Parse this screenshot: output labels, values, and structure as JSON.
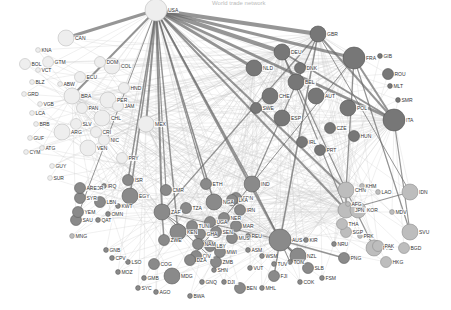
{
  "title": "World trade network",
  "colors": {
    "cluster_americas": "#eeeeee",
    "cluster_europe": "#777777",
    "cluster_africa_asia": "#8a8a8a",
    "cluster_pacific": "#bdbdbd",
    "edge_dark": "#6a6a6a",
    "edge_light": "#c8c8c8"
  },
  "clusters": [
    {
      "name": "americas",
      "color_key": "cluster_americas"
    },
    {
      "name": "europe",
      "color_key": "cluster_europe"
    },
    {
      "name": "africa_asia",
      "color_key": "cluster_africa_asia"
    },
    {
      "name": "pacific",
      "color_key": "cluster_pacific"
    }
  ],
  "nodes": [
    {
      "id": "USA",
      "cluster": "americas",
      "size": "xl"
    },
    {
      "id": "CAN",
      "cluster": "americas",
      "size": "l"
    },
    {
      "id": "KNA",
      "cluster": "americas",
      "size": "s"
    },
    {
      "id": "BOL",
      "cluster": "americas",
      "size": "m"
    },
    {
      "id": "VCT",
      "cluster": "americas",
      "size": "s"
    },
    {
      "id": "GTM",
      "cluster": "americas",
      "size": "m"
    },
    {
      "id": "BLZ",
      "cluster": "americas",
      "size": "s"
    },
    {
      "id": "ABW",
      "cluster": "americas",
      "size": "s"
    },
    {
      "id": "GRD",
      "cluster": "americas",
      "size": "s"
    },
    {
      "id": "VGB",
      "cluster": "americas",
      "size": "s"
    },
    {
      "id": "LCA",
      "cluster": "americas",
      "size": "s"
    },
    {
      "id": "BRB",
      "cluster": "americas",
      "size": "s"
    },
    {
      "id": "GUF",
      "cluster": "americas",
      "size": "s"
    },
    {
      "id": "CYM",
      "cluster": "americas",
      "size": "s"
    },
    {
      "id": "ATG",
      "cluster": "americas",
      "size": "s"
    },
    {
      "id": "GUY",
      "cluster": "americas",
      "size": "s"
    },
    {
      "id": "SUR",
      "cluster": "americas",
      "size": "s"
    },
    {
      "id": "COL",
      "cluster": "americas",
      "size": "l"
    },
    {
      "id": "ECU",
      "cluster": "americas",
      "size": "m"
    },
    {
      "id": "DOM",
      "cluster": "americas",
      "size": "m"
    },
    {
      "id": "HND",
      "cluster": "americas",
      "size": "m"
    },
    {
      "id": "PER",
      "cluster": "americas",
      "size": "l"
    },
    {
      "id": "CHL",
      "cluster": "americas",
      "size": "l"
    },
    {
      "id": "SLV",
      "cluster": "americas",
      "size": "m"
    },
    {
      "id": "PAN",
      "cluster": "americas",
      "size": "m"
    },
    {
      "id": "CRI",
      "cluster": "americas",
      "size": "m"
    },
    {
      "id": "NIC",
      "cluster": "americas",
      "size": "m"
    },
    {
      "id": "VEN",
      "cluster": "americas",
      "size": "l"
    },
    {
      "id": "PRY",
      "cluster": "americas",
      "size": "m"
    },
    {
      "id": "JAM",
      "cluster": "americas",
      "size": "m"
    },
    {
      "id": "MEX",
      "cluster": "americas",
      "size": "l"
    },
    {
      "id": "BRA",
      "cluster": "americas",
      "size": "l"
    },
    {
      "id": "ARG",
      "cluster": "americas",
      "size": "l"
    },
    {
      "id": "GBR",
      "cluster": "europe",
      "size": "l"
    },
    {
      "id": "FRA",
      "cluster": "europe",
      "size": "xl"
    },
    {
      "id": "DEU",
      "cluster": "europe",
      "size": "l"
    },
    {
      "id": "NLD",
      "cluster": "europe",
      "size": "l"
    },
    {
      "id": "BEL",
      "cluster": "europe",
      "size": "l"
    },
    {
      "id": "ESP",
      "cluster": "europe",
      "size": "l"
    },
    {
      "id": "ITA",
      "cluster": "europe",
      "size": "xl"
    },
    {
      "id": "AUT",
      "cluster": "europe",
      "size": "l"
    },
    {
      "id": "CHE",
      "cluster": "europe",
      "size": "l"
    },
    {
      "id": "SWE",
      "cluster": "europe",
      "size": "m"
    },
    {
      "id": "DNK",
      "cluster": "europe",
      "size": "m"
    },
    {
      "id": "POL",
      "cluster": "europe",
      "size": "l"
    },
    {
      "id": "CZE",
      "cluster": "europe",
      "size": "m"
    },
    {
      "id": "HUN",
      "cluster": "europe",
      "size": "m"
    },
    {
      "id": "IRL",
      "cluster": "europe",
      "size": "m"
    },
    {
      "id": "PRT",
      "cluster": "europe",
      "size": "m"
    },
    {
      "id": "GIB",
      "cluster": "europe",
      "size": "s"
    },
    {
      "id": "ROU",
      "cluster": "europe",
      "size": "m"
    },
    {
      "id": "MLT",
      "cluster": "europe",
      "size": "s"
    },
    {
      "id": "SMR",
      "cluster": "europe",
      "size": "s"
    },
    {
      "id": "CHN",
      "cluster": "pacific",
      "size": "l"
    },
    {
      "id": "JPN",
      "cluster": "pacific",
      "size": "l"
    },
    {
      "id": "KOR",
      "cluster": "pacific",
      "size": "l"
    },
    {
      "id": "IDN",
      "cluster": "pacific",
      "size": "l"
    },
    {
      "id": "SVU",
      "cluster": "pacific",
      "size": "l"
    },
    {
      "id": "PHL",
      "cluster": "pacific",
      "size": "l"
    },
    {
      "id": "HKG",
      "cluster": "pacific",
      "size": "m"
    },
    {
      "id": "BGD",
      "cluster": "pacific",
      "size": "m"
    },
    {
      "id": "PAK",
      "cluster": "pacific",
      "size": "m"
    },
    {
      "id": "PRK",
      "cluster": "pacific",
      "size": "s"
    },
    {
      "id": "SGP",
      "cluster": "pacific",
      "size": "m"
    },
    {
      "id": "THA",
      "cluster": "pacific",
      "size": "m"
    },
    {
      "id": "AFG",
      "cluster": "pacific",
      "size": "s"
    },
    {
      "id": "KHM",
      "cluster": "pacific",
      "size": "s"
    },
    {
      "id": "LAO",
      "cluster": "pacific",
      "size": "s"
    },
    {
      "id": "MDV",
      "cluster": "pacific",
      "size": "s"
    },
    {
      "id": "MNG",
      "cluster": "pacific",
      "size": "s"
    },
    {
      "id": "AUS",
      "cluster": "africa_asia",
      "size": "xl"
    },
    {
      "id": "NZL",
      "cluster": "africa_asia",
      "size": "l"
    },
    {
      "id": "PNG",
      "cluster": "africa_asia",
      "size": "m"
    },
    {
      "id": "NRU",
      "cluster": "africa_asia",
      "size": "s"
    },
    {
      "id": "FJI",
      "cluster": "africa_asia",
      "size": "m"
    },
    {
      "id": "SLB",
      "cluster": "africa_asia",
      "size": "m"
    },
    {
      "id": "TON",
      "cluster": "africa_asia",
      "size": "s"
    },
    {
      "id": "VUT",
      "cluster": "africa_asia",
      "size": "s"
    },
    {
      "id": "WSM",
      "cluster": "africa_asia",
      "size": "s"
    },
    {
      "id": "TUV",
      "cluster": "africa_asia",
      "size": "s"
    },
    {
      "id": "KIR",
      "cluster": "africa_asia",
      "size": "s"
    },
    {
      "id": "MHL",
      "cluster": "africa_asia",
      "size": "s"
    },
    {
      "id": "FSM",
      "cluster": "africa_asia",
      "size": "s"
    },
    {
      "id": "COK",
      "cluster": "africa_asia",
      "size": "s"
    },
    {
      "id": "ASM",
      "cluster": "africa_asia",
      "size": "s"
    },
    {
      "id": "EGY",
      "cluster": "africa_asia",
      "size": "l"
    },
    {
      "id": "SAU",
      "cluster": "africa_asia",
      "size": "m"
    },
    {
      "id": "YEM",
      "cluster": "africa_asia",
      "size": "m"
    },
    {
      "id": "OMN",
      "cluster": "africa_asia",
      "size": "s"
    },
    {
      "id": "QAT",
      "cluster": "africa_asia",
      "size": "s"
    },
    {
      "id": "KWT",
      "cluster": "africa_asia",
      "size": "s"
    },
    {
      "id": "IRQ",
      "cluster": "africa_asia",
      "size": "s"
    },
    {
      "id": "SYR",
      "cluster": "africa_asia",
      "size": "m"
    },
    {
      "id": "LBN",
      "cluster": "africa_asia",
      "size": "m"
    },
    {
      "id": "JOR",
      "cluster": "africa_asia",
      "size": "s"
    },
    {
      "id": "ARE",
      "cluster": "africa_asia",
      "size": "m"
    },
    {
      "id": "ISR",
      "cluster": "africa_asia",
      "size": "m"
    },
    {
      "id": "ETH",
      "cluster": "africa_asia",
      "size": "m"
    },
    {
      "id": "KEN",
      "cluster": "africa_asia",
      "size": "l"
    },
    {
      "id": "TZA",
      "cluster": "africa_asia",
      "size": "m"
    },
    {
      "id": "UGA",
      "cluster": "africa_asia",
      "size": "m"
    },
    {
      "id": "ZAF",
      "cluster": "africa_asia",
      "size": "l"
    },
    {
      "id": "ZWE",
      "cluster": "africa_asia",
      "size": "m"
    },
    {
      "id": "ZMB",
      "cluster": "africa_asia",
      "size": "m"
    },
    {
      "id": "MOZ",
      "cluster": "africa_asia",
      "size": "s"
    },
    {
      "id": "MWI",
      "cluster": "africa_asia",
      "size": "m"
    },
    {
      "id": "MDG",
      "cluster": "africa_asia",
      "size": "l"
    },
    {
      "id": "SYC",
      "cluster": "africa_asia",
      "size": "s"
    },
    {
      "id": "AGO",
      "cluster": "africa_asia",
      "size": "s"
    },
    {
      "id": "BWA",
      "cluster": "africa_asia",
      "size": "s"
    },
    {
      "id": "LSO",
      "cluster": "africa_asia",
      "size": "s"
    },
    {
      "id": "GMB",
      "cluster": "africa_asia",
      "size": "s"
    },
    {
      "id": "GNB",
      "cluster": "africa_asia",
      "size": "s"
    },
    {
      "id": "CPV",
      "cluster": "africa_asia",
      "size": "s"
    },
    {
      "id": "GNQ",
      "cluster": "africa_asia",
      "size": "s"
    },
    {
      "id": "DJI",
      "cluster": "africa_asia",
      "size": "s"
    },
    {
      "id": "BEN",
      "cluster": "africa_asia",
      "size": "m"
    },
    {
      "id": "COG",
      "cluster": "africa_asia",
      "size": "m"
    },
    {
      "id": "CIV",
      "cluster": "africa_asia",
      "size": "m"
    },
    {
      "id": "SEN",
      "cluster": "africa_asia",
      "size": "m"
    },
    {
      "id": "SHN",
      "cluster": "africa_asia",
      "size": "s"
    },
    {
      "id": "DZA",
      "cluster": "africa_asia",
      "size": "m"
    },
    {
      "id": "CMR",
      "cluster": "africa_asia",
      "size": "m"
    },
    {
      "id": "GHA",
      "cluster": "africa_asia",
      "size": "m"
    },
    {
      "id": "NGA",
      "cluster": "africa_asia",
      "size": "l"
    },
    {
      "id": "SDN",
      "cluster": "africa_asia",
      "size": "m"
    },
    {
      "id": "TUN",
      "cluster": "africa_asia",
      "size": "m"
    },
    {
      "id": "MAR",
      "cluster": "africa_asia",
      "size": "m"
    },
    {
      "id": "LBY",
      "cluster": "africa_asia",
      "size": "m"
    },
    {
      "id": "IRN",
      "cluster": "africa_asia",
      "size": "m"
    },
    {
      "id": "IND",
      "cluster": "africa_asia",
      "size": "l"
    },
    {
      "id": "LKA",
      "cluster": "africa_asia",
      "size": "m"
    },
    {
      "id": "REU",
      "cluster": "africa_asia",
      "size": "s"
    },
    {
      "id": "MUS",
      "cluster": "africa_asia",
      "size": "m"
    },
    {
      "id": "NER",
      "cluster": "africa_asia",
      "size": "m"
    },
    {
      "id": "NAM",
      "cluster": "africa_asia",
      "size": "m"
    }
  ]
}
